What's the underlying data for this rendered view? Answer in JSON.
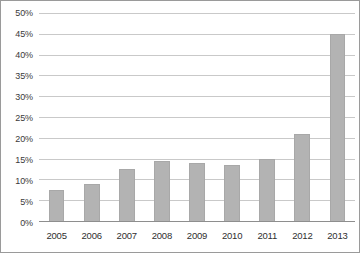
{
  "chart_data": {
    "type": "bar",
    "title": "",
    "subtitle": "",
    "xlabel": "",
    "ylabel": "",
    "categories": [
      "2005",
      "2006",
      "2007",
      "2008",
      "2009",
      "2010",
      "2011",
      "2012",
      "2013"
    ],
    "values": [
      7.5,
      9,
      12.5,
      14.5,
      14,
      13.5,
      15,
      21,
      45
    ],
    "value_unit": "%",
    "ylim": [
      0,
      50
    ],
    "ytick_values": [
      0,
      5,
      10,
      15,
      20,
      25,
      30,
      35,
      40,
      45,
      50
    ],
    "ytick_labels": [
      "0%",
      "5%",
      "10%",
      "15%",
      "20%",
      "25%",
      "30%",
      "35%",
      "40%",
      "45%",
      "50%"
    ],
    "grid": true,
    "grid_axis": "y",
    "legend": false,
    "legend_position": "none",
    "series": [
      {
        "name": "",
        "values": [
          7.5,
          9,
          12.5,
          14.5,
          14,
          13.5,
          15,
          21,
          45
        ]
      }
    ],
    "annotations": []
  },
  "style": {
    "bar_color": "#b3b3b3",
    "bar_edge_color": "#a8a8a8",
    "gridline_color": "#c9c9c9",
    "baseline_color": "#8e8e8e",
    "axis_text_color": "#2f2f2f",
    "ytick_text_color": "#3a3a3a",
    "background_color": "#ffffff",
    "frame_border_color": "#9a9a9a"
  }
}
